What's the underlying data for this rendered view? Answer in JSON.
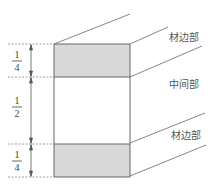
{
  "diagram": {
    "type": "cross-section-proportion",
    "colors": {
      "stroke": "#666666",
      "shade": "#d9d9d9",
      "text": "#444444",
      "dashed": "#888888"
    },
    "sections": [
      {
        "name": "top-edge",
        "label": "材边部",
        "fraction_num": "1",
        "fraction_den": "4",
        "shaded": true
      },
      {
        "name": "middle",
        "label": "中间部",
        "fraction_num": "1",
        "fraction_den": "2",
        "shaded": false
      },
      {
        "name": "bottom-edge",
        "label": "材边部",
        "fraction_num": "1",
        "fraction_den": "4",
        "shaded": true
      }
    ]
  }
}
